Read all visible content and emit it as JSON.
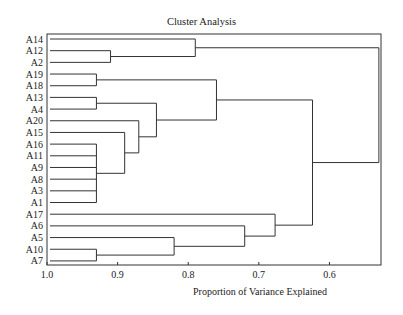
{
  "chart_data": {
    "type": "dendrogram",
    "title": "Cluster Analysis",
    "xlabel": "Proportion of Variance Explained",
    "ylabel": "",
    "xlim": [
      1.0,
      0.527
    ],
    "x_ticks": [
      1.0,
      0.9,
      0.8,
      0.7,
      0.6
    ],
    "x_tick_labels": [
      "1.0",
      "0.9",
      "0.8",
      "0.7",
      "0.6"
    ],
    "grid": false,
    "leaves": [
      "A14",
      "A12",
      "A2",
      "A19",
      "A18",
      "A13",
      "A4",
      "A20",
      "A15",
      "A16",
      "A11",
      "A9",
      "A8",
      "A3",
      "A1",
      "A17",
      "A6",
      "A5",
      "A10",
      "A7"
    ],
    "merges": [
      {
        "id": "c1",
        "children": [
          "A12",
          "A2"
        ],
        "height": 0.91
      },
      {
        "id": "c2",
        "children": [
          "A14",
          "c1"
        ],
        "height": 0.79
      },
      {
        "id": "c3",
        "children": [
          "A19",
          "A18"
        ],
        "height": 0.93
      },
      {
        "id": "c4",
        "children": [
          "A13",
          "A4"
        ],
        "height": 0.93
      },
      {
        "id": "c5",
        "children": [
          "A16",
          "A11",
          "A9",
          "A8",
          "A3",
          "A1"
        ],
        "height": 0.93
      },
      {
        "id": "c6",
        "children": [
          "A15",
          "c5"
        ],
        "height": 0.89
      },
      {
        "id": "c7",
        "children": [
          "A20",
          "c6"
        ],
        "height": 0.87
      },
      {
        "id": "c8",
        "children": [
          "c4",
          "c7"
        ],
        "height": 0.845
      },
      {
        "id": "c9",
        "children": [
          "c3",
          "c8"
        ],
        "height": 0.76
      },
      {
        "id": "c10",
        "children": [
          "A10",
          "A7"
        ],
        "height": 0.93
      },
      {
        "id": "c11",
        "children": [
          "A5",
          "c10"
        ],
        "height": 0.82
      },
      {
        "id": "c12",
        "children": [
          "A6",
          "c11"
        ],
        "height": 0.72
      },
      {
        "id": "c13",
        "children": [
          "A17",
          "c12"
        ],
        "height": 0.677
      },
      {
        "id": "c14",
        "children": [
          "c9",
          "c13"
        ],
        "height": 0.624
      },
      {
        "id": "c15",
        "children": [
          "c2",
          "c14"
        ],
        "height": 0.53
      }
    ]
  }
}
